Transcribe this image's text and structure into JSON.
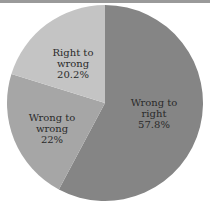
{
  "chart_data": {
    "type": "pie",
    "title": "",
    "categories": [
      "Wrong to right",
      "Wrong to wrong",
      "Right to wrong"
    ],
    "values": [
      57.8,
      22,
      20.2
    ],
    "labels": [
      "57.8%",
      "22%",
      "20.2%"
    ],
    "colors": [
      "#858585",
      "#a6a6a6",
      "#c4c4c4"
    ],
    "start_angle_deg": 0,
    "direction": "clockwise",
    "legend": "none (labels inside slices)"
  },
  "slices": [
    {
      "line1": "Wrong to",
      "line2": "right",
      "line3": "57.8%",
      "color": "#858585"
    },
    {
      "line1": "Wrong to",
      "line2": "wrong",
      "line3": "22%",
      "color": "#a6a6a6"
    },
    {
      "line1": "Right to",
      "line2": "wrong",
      "line3": "20.2%",
      "color": "#c4c4c4"
    }
  ]
}
